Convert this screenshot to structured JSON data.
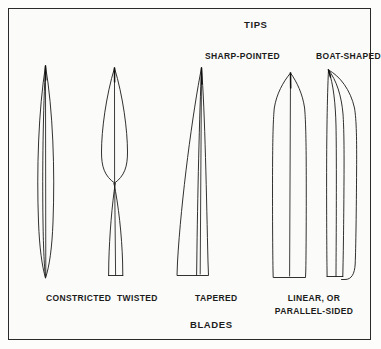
{
  "figure": {
    "title_top": "TIPS",
    "title_bottom": "BLADES",
    "background_color": "#fbfbf9",
    "line_color": "#1a1a1a",
    "border_color": "#2a2a2a"
  },
  "tip_labels": [
    {
      "id": "sharp-pointed",
      "text": "SHARP-POINTED"
    },
    {
      "id": "boat-shaped",
      "text": "BOAT-SHAPED"
    }
  ],
  "blade_labels": [
    {
      "id": "constricted",
      "text": "CONSTRICTED"
    },
    {
      "id": "twisted",
      "text": "TWISTED"
    },
    {
      "id": "tapered",
      "text": "TAPERED"
    },
    {
      "id": "linear-line1",
      "text": "LINEAR, OR"
    },
    {
      "id": "linear-line2",
      "text": "PARALLEL-SIDED"
    }
  ],
  "specimens": [
    {
      "id": "constricted-blade",
      "name": "constricted-blade",
      "label": "CONSTRICTED",
      "category": "blade",
      "description": "narrow lens-shaped blade pointed at both ends with central midrib"
    },
    {
      "id": "twisted-blade",
      "name": "twisted-blade",
      "label": "TWISTED",
      "category": "blade",
      "description": "blade pinched and crossed at mid-height forming a twist, flat base"
    },
    {
      "id": "tapered-blade",
      "name": "tapered-blade",
      "label": "TAPERED",
      "category": "blade",
      "description": "triangular blade widening from sharp tip to broad flat base"
    },
    {
      "id": "linear-sharp-pointed-blade",
      "name": "linear-sharp-pointed-blade",
      "label": "LINEAR, OR PARALLEL-SIDED",
      "category": "blade",
      "tip": "SHARP-POINTED",
      "description": "parallel-sided blade with sharp-pointed gothic-arch tip"
    },
    {
      "id": "linear-boat-shaped-blade",
      "name": "linear-boat-shaped-blade",
      "label": "LINEAR, OR PARALLEL-SIDED",
      "category": "blade",
      "tip": "BOAT-SHAPED",
      "description": "parallel-sided blade with hooded boat-shaped curving tip"
    }
  ]
}
